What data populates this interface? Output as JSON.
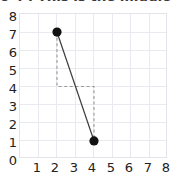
{
  "chart_data": {
    "type": "line",
    "title": "o 4 : This is the middle ite",
    "xlabel": "",
    "ylabel": "",
    "xlim": [
      0,
      8
    ],
    "ylim": [
      0,
      8
    ],
    "xticks": [
      1,
      2,
      3,
      4,
      5,
      6,
      7,
      8
    ],
    "yticks": [
      0,
      1,
      2,
      3,
      4,
      5,
      6,
      7,
      8
    ],
    "grid": true,
    "legend": "none",
    "series": [
      {
        "name": "points",
        "style": "solid-line-with-markers",
        "color": "#3d3d3d",
        "marker_color": "#111111",
        "x": [
          2,
          4
        ],
        "y": [
          7,
          1
        ]
      },
      {
        "name": "midpoint-guide",
        "style": "dashed-step",
        "color": "#9a9a9a",
        "x": [
          2,
          2,
          4,
          4
        ],
        "y": [
          7,
          4,
          4,
          1
        ]
      }
    ],
    "annotations": [
      {
        "label": "midpoint level",
        "value": 4,
        "axis": "y"
      }
    ]
  },
  "axes": {
    "y_tick_labels": [
      "8",
      "7",
      "6",
      "5",
      "4",
      "3",
      "2",
      "1",
      "0"
    ],
    "x_tick_labels": [
      "1",
      "2",
      "3",
      "4",
      "5",
      "6",
      "7",
      "8"
    ]
  },
  "colors": {
    "grid": "#e9e9f0",
    "frame": "#e3e3ea",
    "line": "#3d3d3d",
    "dash": "#9a9a9a",
    "marker": "#111111",
    "text": "#222222",
    "title": "#3a3a3a",
    "background": "#ffffff"
  }
}
